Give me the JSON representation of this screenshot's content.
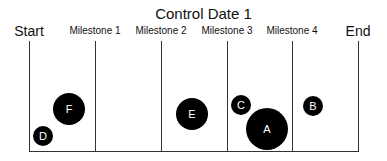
{
  "title": "Control Date 1",
  "axis": {
    "labels": [
      {
        "text": "Start",
        "x": 29,
        "big": true
      },
      {
        "text": "Milestone 1",
        "x": 95,
        "big": false
      },
      {
        "text": "Milestone 2",
        "x": 161,
        "big": false
      },
      {
        "text": "Milestone 3",
        "x": 227,
        "big": false
      },
      {
        "text": "Milestone 4",
        "x": 292,
        "big": false
      },
      {
        "text": "End",
        "x": 358,
        "big": true
      }
    ]
  },
  "bubbles": [
    {
      "label": "F",
      "x": 69,
      "y": 109,
      "r": 16
    },
    {
      "label": "D",
      "x": 43,
      "y": 136,
      "r": 10
    },
    {
      "label": "E",
      "x": 192,
      "y": 114,
      "r": 16
    },
    {
      "label": "C",
      "x": 241,
      "y": 105,
      "r": 10
    },
    {
      "label": "A",
      "x": 267,
      "y": 129,
      "r": 21
    },
    {
      "label": "B",
      "x": 313,
      "y": 106,
      "r": 10
    }
  ]
}
